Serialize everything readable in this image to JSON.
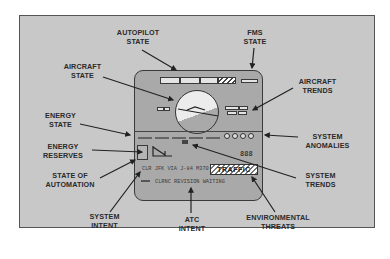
{
  "diagram": {
    "labels": {
      "autopilot_state": [
        "AUTOPILOT",
        "STATE"
      ],
      "fms_state": [
        "FMS",
        "STATE"
      ],
      "aircraft_state": [
        "AIRCRAFT",
        "STATE"
      ],
      "aircraft_trends": [
        "AIRCRAFT",
        "TRENDS"
      ],
      "energy_state": [
        "ENERGY",
        "STATE"
      ],
      "system_anomalies": [
        "SYSTEM",
        "ANOMALIES"
      ],
      "energy_reserves": [
        "ENERGY",
        "RESERVES"
      ],
      "state_of_automation": [
        "STATE OF",
        "AUTOMATION"
      ],
      "system_trends": [
        "SYSTEM",
        "TRENDS"
      ],
      "system_intent": [
        "SYSTEM",
        "INTENT"
      ],
      "atc_intent": [
        "ATC",
        "INTENT"
      ],
      "environmental_threats": [
        "ENVIRONMENTAL",
        "THREATS"
      ]
    },
    "display": {
      "clearance_text": "CLR JFK VIA J-84 M370",
      "atc_message": "CLRNC REVISION WAITING",
      "traffic_alert": "TRAFFIC",
      "numeric_readout": "888"
    },
    "colors": {
      "frame_background": "#c8c8c8",
      "panel_background": "#a9a9a9",
      "stroke": "#333333"
    }
  }
}
